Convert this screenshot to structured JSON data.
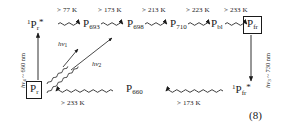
{
  "figure": {
    "equation_number": "(8)",
    "top_row": {
      "nodes": [
        {
          "name": "Pr-excited",
          "prefix": "1",
          "base": "P",
          "sub": "r",
          "star": "*",
          "boxed": false
        },
        {
          "name": "P693",
          "prefix": "",
          "base": "P",
          "sub": "693",
          "star": "",
          "boxed": false
        },
        {
          "name": "P698",
          "prefix": "",
          "base": "P",
          "sub": "698",
          "star": "",
          "boxed": false
        },
        {
          "name": "P710",
          "prefix": "",
          "base": "P",
          "sub": "710",
          "star": "",
          "boxed": false
        },
        {
          "name": "Pbl",
          "prefix": "",
          "base": "P",
          "sub": "bl",
          "star": "",
          "boxed": false
        },
        {
          "name": "Pfr",
          "prefix": "",
          "base": "P",
          "sub": "fr",
          "star": "",
          "boxed": true
        }
      ],
      "transitions": [
        "> 77 K",
        "> 173 K",
        "> 213 K",
        "> 223 K",
        "> 233 K"
      ]
    },
    "bottom_row": {
      "nodes": [
        {
          "name": "Pr-ground",
          "prefix": "",
          "base": "P",
          "sub": "r",
          "star": "",
          "boxed": true
        },
        {
          "name": "P660",
          "prefix": "",
          "base": "P",
          "sub": "660",
          "star": "",
          "boxed": false
        },
        {
          "name": "Pfr-excited",
          "prefix": "1",
          "base": "P",
          "sub": "fr",
          "star": "*",
          "boxed": false
        }
      ],
      "transitions": [
        "> 233 K",
        "> 173 K"
      ]
    },
    "photon_labels": {
      "left_vertical": "hv4 ~ 660 nm",
      "left_vertical_symbol": "h",
      "left_vertical_nu": "ν",
      "left_vertical_sub": "4",
      "left_vertical_rest": " ~ 660 nm",
      "right_vertical_symbol": "h",
      "right_vertical_nu": "ν",
      "right_vertical_sub": "3",
      "right_vertical_rest": " ~ 730 nm",
      "diagonal_1_symbol": "h",
      "diagonal_1_nu": "ν",
      "diagonal_1_sub": "1",
      "diagonal_2_symbol": "h",
      "diagonal_2_nu": "ν",
      "diagonal_2_sub": "2"
    },
    "colors": {
      "ink": "#1a1a1a",
      "background": "#ffffff"
    }
  }
}
